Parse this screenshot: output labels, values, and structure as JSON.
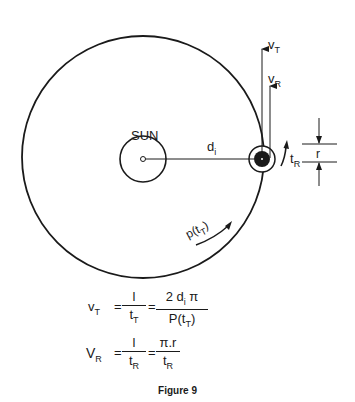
{
  "diagram": {
    "sun_label": "SUN",
    "distance_label": "d",
    "distance_sub": "i",
    "vt_label": "v",
    "vt_sub": "T",
    "vr_label": "v",
    "vr_sub": "R",
    "tr_label": "t",
    "tr_sub": "R",
    "r_label": "r",
    "period_label": "p(t",
    "period_sub": "T",
    "period_close": ")",
    "stroke_color": "#1a1a1a"
  },
  "equations": {
    "eq1": {
      "lhs": "v",
      "lhs_sub": "T",
      "eq": "=",
      "frac1_num": "l",
      "frac1_den": "t",
      "frac1_den_sub": "T",
      "eq2": "=",
      "frac2_num": "2 d",
      "frac2_num_sub": "i",
      "frac2_num_tail": " π",
      "frac2_den": "P(t",
      "frac2_den_sub": "T",
      "frac2_den_tail": ")"
    },
    "eq2": {
      "lhs": "V",
      "lhs_sub": "R",
      "eq": "=",
      "frac1_num": "l",
      "frac1_den": "t",
      "frac1_den_sub": "R",
      "eq2": "=",
      "frac2_num": "π.r",
      "frac2_den": "t",
      "frac2_den_sub": "R"
    }
  },
  "caption": "Figure 9"
}
